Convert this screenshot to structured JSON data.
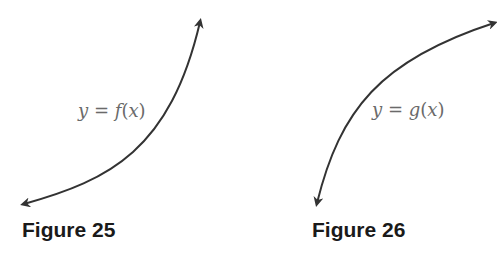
{
  "figures": [
    {
      "caption": "Figure 25",
      "label": {
        "lhs": "y",
        "eq": "=",
        "fn": "f",
        "arg": "x"
      },
      "curve": {
        "shape": "concave-up increasing",
        "start": [
          22,
          205
        ],
        "end": [
          201,
          20
        ]
      }
    },
    {
      "caption": "Figure 26",
      "label": {
        "lhs": "y",
        "eq": "=",
        "fn": "g",
        "arg": "x"
      },
      "curve": {
        "shape": "concave-down increasing",
        "start": [
          316,
          205
        ],
        "end": [
          495,
          22
        ]
      }
    }
  ],
  "colors": {
    "curve": "#333333",
    "label": "#6a6a6a",
    "caption": "#1a1a1a",
    "background": "#ffffff"
  }
}
